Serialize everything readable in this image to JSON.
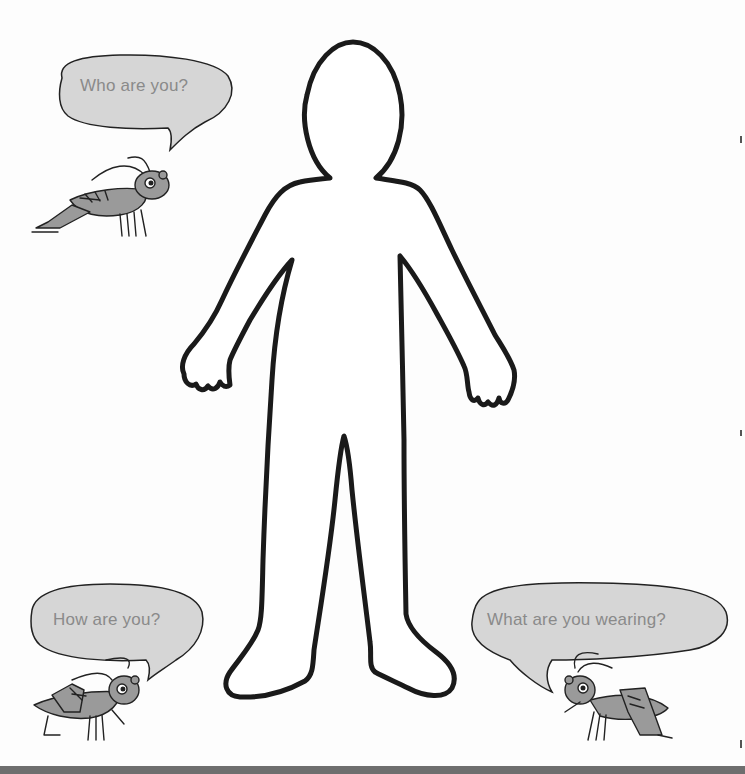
{
  "worksheet": {
    "figure": {
      "label": "blank body outline",
      "outline_color": "#1a1a1a",
      "fill_color": "#ffffff"
    },
    "bubbles": [
      {
        "id": "top-left",
        "text": "Who are you?",
        "fill_color": "#d6d6d6",
        "text_color": "#8a8a8a"
      },
      {
        "id": "bottom-left",
        "text": "How are you?",
        "fill_color": "#d6d6d6",
        "text_color": "#8a8a8a"
      },
      {
        "id": "bottom-right",
        "text": "What are you wearing?",
        "fill_color": "#d6d6d6",
        "text_color": "#8a8a8a"
      }
    ],
    "characters": [
      {
        "id": "cricket-top-left",
        "kind": "cricket",
        "body_color": "#9a9a9a"
      },
      {
        "id": "cricket-bottom-left",
        "kind": "cricket",
        "body_color": "#9a9a9a"
      },
      {
        "id": "cricket-bottom-right",
        "kind": "cricket",
        "body_color": "#9a9a9a"
      }
    ],
    "bottom_bar_color": "#6e6e6e"
  }
}
